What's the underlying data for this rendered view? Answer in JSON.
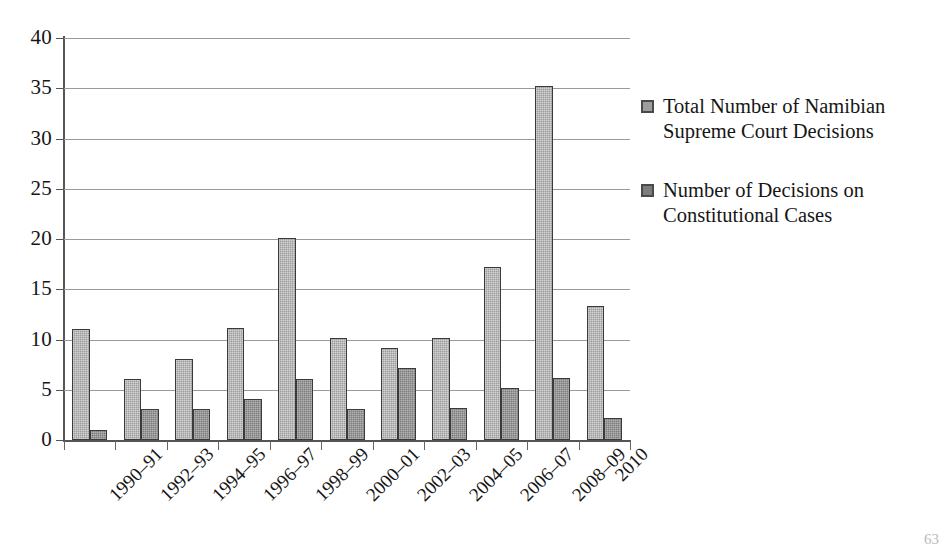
{
  "chart_data": {
    "type": "bar",
    "title": "",
    "subtitle": "",
    "xlabel": "",
    "ylabel": "",
    "ylim": [
      0,
      40
    ],
    "yticks": [
      0,
      5,
      10,
      15,
      20,
      25,
      30,
      35,
      40
    ],
    "grid": true,
    "legend_position": "right",
    "categories": [
      "1990–91",
      "1992–93",
      "1994–95",
      "1996–97",
      "1998–99",
      "2000–01",
      "2002–03",
      "2004–05",
      "2006–07",
      "2008–09",
      "2010"
    ],
    "series": [
      {
        "name": "Total Number of Namibian Supreme Court Decisions",
        "color": "#9d9d9d",
        "values": [
          11.0,
          6.1,
          8.1,
          11.1,
          20.1,
          10.2,
          9.2,
          10.2,
          17.2,
          35.2,
          13.3
        ]
      },
      {
        "name": "Number of Decisions on Constitutional Cases",
        "color": "#7d7d7d",
        "values": [
          1.0,
          3.1,
          3.1,
          4.1,
          6.1,
          3.1,
          7.2,
          3.2,
          5.2,
          6.2,
          2.2
        ]
      }
    ]
  },
  "legend": {
    "items": [
      {
        "label": "Total Number of Namibian Supreme Court Decisions",
        "swatch": "total"
      },
      {
        "label": "Number of Decisions on Constitutional Cases",
        "swatch": "constitutional"
      }
    ]
  },
  "footer": {
    "page_number": "63"
  }
}
